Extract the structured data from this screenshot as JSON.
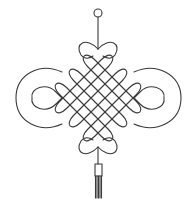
{
  "illustration": {
    "subject": "Chinese knot ornament",
    "background_color": "#ffffff",
    "line_color": "#3a3a3a",
    "parts": [
      "hanging-ring",
      "hanging-cord",
      "top-heart-loops",
      "diamond-lattice",
      "side-loops",
      "bottom-heart-loops",
      "tassel-cord",
      "tassel-bead",
      "tassel-strands"
    ],
    "lattice_lines_per_direction": 6,
    "tassel_strand_count": 5
  }
}
